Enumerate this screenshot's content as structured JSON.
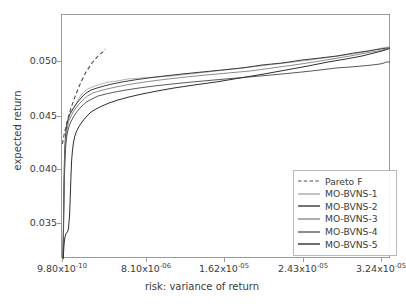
{
  "chart_data": {
    "type": "line",
    "title": "",
    "xlabel": "risk: variance of return",
    "ylabel": "expected return",
    "grid": false,
    "legend_position": "lower right",
    "xlim": [
      9.8e-10,
      3.24e-05
    ],
    "ylim": [
      0.032,
      0.0536
    ],
    "xticks": [
      {
        "value": 9.8e-10,
        "label": "9.80x10",
        "exp": "-10",
        "px": 62
      },
      {
        "value": 8.1e-06,
        "label": "8.10x10",
        "exp": "-06",
        "px": 146
      },
      {
        "value": 1.62e-05,
        "label": "1.62x10",
        "exp": "-05",
        "px": 224
      },
      {
        "value": 2.43e-05,
        "label": "2.43x10",
        "exp": "-05",
        "px": 303
      },
      {
        "value": 3.24e-05,
        "label": "3.24x10",
        "exp": "-05",
        "px": 381
      }
    ],
    "yticks": [
      {
        "value": 0.05,
        "label": "0.050",
        "px": 61
      },
      {
        "value": 0.045,
        "label": "0.045",
        "px": 116
      },
      {
        "value": 0.04,
        "label": "0.040",
        "px": 169
      },
      {
        "value": 0.035,
        "label": "0.035",
        "px": 223
      }
    ],
    "series": [
      {
        "name": "Pareto F",
        "color": "#4a4a4a",
        "style": "dashed",
        "width": 1.1,
        "points": [
          [
            0.4,
            129
          ],
          [
            2.0,
            120
          ],
          [
            5.0,
            107
          ],
          [
            9.0,
            93
          ],
          [
            14.0,
            79
          ],
          [
            19.0,
            67
          ],
          [
            24.0,
            57
          ],
          [
            30.0,
            48
          ],
          [
            36.0,
            41
          ],
          [
            42.0,
            36
          ],
          [
            43.0,
            34
          ]
        ]
      },
      {
        "name": "MO-BVNS-1",
        "color": "#a9a9a9",
        "style": "solid",
        "width": 0.9,
        "points": [
          [
            1.0,
            243
          ],
          [
            1.2,
            230
          ],
          [
            1.4,
            215
          ],
          [
            1.6,
            200
          ],
          [
            1.8,
            188
          ],
          [
            2.0,
            176
          ],
          [
            2.2,
            166
          ],
          [
            2.4,
            158
          ],
          [
            2.6,
            150
          ],
          [
            2.9,
            142
          ],
          [
            3.2,
            134
          ],
          [
            3.6,
            128
          ],
          [
            4.0,
            122
          ],
          [
            4.6,
            116
          ],
          [
            5.4,
            110
          ],
          [
            6.2,
            105
          ],
          [
            7.2,
            101
          ],
          [
            8.4,
            99
          ],
          [
            10.0,
            96
          ],
          [
            12.0,
            92
          ],
          [
            14.6,
            88
          ],
          [
            17.0,
            83
          ],
          [
            20.0,
            79
          ],
          [
            24.0,
            75
          ],
          [
            28.0,
            73
          ],
          [
            33.0,
            71
          ],
          [
            39.0,
            69
          ],
          [
            46.0,
            67
          ],
          [
            55.0,
            66
          ],
          [
            66.0,
            64
          ],
          [
            80.0,
            63
          ],
          [
            95.0,
            62
          ],
          [
            110.0,
            61
          ],
          [
            128.0,
            59
          ],
          [
            145.0,
            57
          ],
          [
            162.0,
            55
          ],
          [
            180.0,
            53
          ],
          [
            198.0,
            51
          ],
          [
            214.0,
            49
          ],
          [
            232.0,
            47
          ],
          [
            248.0,
            45
          ],
          [
            262.0,
            43
          ],
          [
            276.0,
            41
          ],
          [
            290.0,
            39
          ],
          [
            302.0,
            37
          ],
          [
            312.0,
            35
          ],
          [
            320.0,
            33
          ],
          [
            326.0,
            32
          ],
          [
            328.0,
            32
          ]
        ]
      },
      {
        "name": "MO-BVNS-2",
        "color": "#3c3c3c",
        "style": "solid",
        "width": 1.0,
        "points": [
          [
            1.0,
            244
          ],
          [
            1.1,
            236
          ],
          [
            1.3,
            222
          ],
          [
            1.5,
            206
          ],
          [
            1.7,
            190
          ],
          [
            1.9,
            176
          ],
          [
            2.1,
            162
          ],
          [
            2.3,
            150
          ],
          [
            2.6,
            140
          ],
          [
            2.9,
            131
          ],
          [
            3.3,
            124
          ],
          [
            3.8,
            118
          ],
          [
            4.4,
            113
          ],
          [
            5.2,
            108
          ],
          [
            6.2,
            104
          ],
          [
            7.4,
            100
          ],
          [
            9.0,
            97
          ],
          [
            11.0,
            94
          ],
          [
            13.5,
            90
          ],
          [
            16.5,
            86
          ],
          [
            20.0,
            82
          ],
          [
            24.0,
            78
          ],
          [
            29.0,
            75
          ],
          [
            35.0,
            73
          ],
          [
            42.0,
            71
          ],
          [
            50.0,
            69
          ],
          [
            60.0,
            67
          ],
          [
            72.0,
            65
          ],
          [
            86.0,
            63
          ],
          [
            102.0,
            61
          ],
          [
            120.0,
            59
          ],
          [
            140.0,
            57
          ],
          [
            160.0,
            55
          ],
          [
            180.0,
            53
          ],
          [
            200.0,
            50
          ],
          [
            220.0,
            48
          ],
          [
            240.0,
            45
          ],
          [
            258.0,
            43
          ],
          [
            275.0,
            41
          ],
          [
            292.0,
            38
          ],
          [
            306.0,
            36
          ],
          [
            318.0,
            34
          ],
          [
            326.0,
            33
          ],
          [
            328.0,
            33
          ]
        ]
      },
      {
        "name": "MO-BVNS-3",
        "color": "#8c8c8c",
        "style": "solid",
        "width": 1.0,
        "points": [
          [
            1.0,
            245
          ],
          [
            1.2,
            234
          ],
          [
            1.5,
            218
          ],
          [
            1.8,
            198
          ],
          [
            2.1,
            178
          ],
          [
            2.4,
            162
          ],
          [
            2.7,
            150
          ],
          [
            3.0,
            140
          ],
          [
            3.4,
            132
          ],
          [
            3.9,
            125
          ],
          [
            4.5,
            119
          ],
          [
            5.3,
            113
          ],
          [
            6.3,
            108
          ],
          [
            7.6,
            104
          ],
          [
            9.2,
            101
          ],
          [
            11.2,
            97
          ],
          [
            13.8,
            93
          ],
          [
            17.0,
            89
          ],
          [
            21.0,
            85
          ],
          [
            25.5,
            81
          ],
          [
            31.0,
            78
          ],
          [
            37.0,
            76
          ],
          [
            45.0,
            74
          ],
          [
            54.0,
            72
          ],
          [
            64.0,
            70
          ],
          [
            76.0,
            68
          ],
          [
            90.0,
            66
          ],
          [
            106.0,
            64
          ],
          [
            124.0,
            62
          ],
          [
            144.0,
            60
          ],
          [
            166.0,
            58
          ],
          [
            188.0,
            56
          ],
          [
            210.0,
            53
          ],
          [
            232.0,
            50
          ],
          [
            252.0,
            47
          ],
          [
            270.0,
            44
          ],
          [
            288.0,
            41
          ],
          [
            304.0,
            38
          ],
          [
            316.0,
            36
          ],
          [
            324.0,
            34
          ],
          [
            328.0,
            33
          ]
        ]
      },
      {
        "name": "MO-BVNS-4",
        "color": "#5a5a5a",
        "style": "solid",
        "width": 1.0,
        "points": [
          [
            1.0,
            246
          ],
          [
            1.1,
            240
          ],
          [
            1.3,
            228
          ],
          [
            1.5,
            212
          ],
          [
            1.7,
            196
          ],
          [
            2.0,
            180
          ],
          [
            2.3,
            165
          ],
          [
            2.7,
            152
          ],
          [
            3.1,
            142
          ],
          [
            3.6,
            133
          ],
          [
            4.2,
            126
          ],
          [
            5.0,
            120
          ],
          [
            6.0,
            115
          ],
          [
            7.2,
            111
          ],
          [
            8.8,
            107
          ],
          [
            10.8,
            103
          ],
          [
            13.2,
            99
          ],
          [
            16.2,
            95
          ],
          [
            20.0,
            91
          ],
          [
            24.5,
            87
          ],
          [
            30.0,
            84
          ],
          [
            36.0,
            81
          ],
          [
            44.0,
            79
          ],
          [
            53.0,
            77
          ],
          [
            64.0,
            75
          ],
          [
            77.0,
            73
          ],
          [
            92.0,
            71
          ],
          [
            110.0,
            69
          ],
          [
            130.0,
            67
          ],
          [
            152.0,
            65
          ],
          [
            175.0,
            63
          ],
          [
            198.0,
            61
          ],
          [
            220.0,
            59
          ],
          [
            240.0,
            57
          ],
          [
            258.0,
            55
          ],
          [
            274.0,
            53
          ],
          [
            288.0,
            52
          ],
          [
            300.0,
            51
          ],
          [
            310.0,
            50
          ],
          [
            318.0,
            49
          ],
          [
            322.0,
            48
          ],
          [
            324.0,
            47
          ],
          [
            328.0,
            47
          ]
        ]
      },
      {
        "name": "MO-BVNS-5",
        "color": "#2f2f2f",
        "style": "solid",
        "width": 1.0,
        "points": [
          [
            1.0,
            247
          ],
          [
            1.2,
            243
          ],
          [
            1.5,
            238
          ],
          [
            1.9,
            232
          ],
          [
            2.4,
            226
          ],
          [
            3.0,
            222
          ],
          [
            3.8,
            219
          ],
          [
            4.6,
            218
          ],
          [
            5.4,
            217
          ],
          [
            6.4,
            214
          ],
          [
            7.6,
            200
          ],
          [
            8.4,
            178
          ],
          [
            9.0,
            160
          ],
          [
            9.6,
            146
          ],
          [
            10.4,
            136
          ],
          [
            11.4,
            128
          ],
          [
            12.6,
            122
          ],
          [
            14.2,
            117
          ],
          [
            16.2,
            113
          ],
          [
            18.6,
            109
          ],
          [
            21.5,
            105
          ],
          [
            25.0,
            101
          ],
          [
            29.0,
            97
          ],
          [
            34.0,
            94
          ],
          [
            40.0,
            91
          ],
          [
            47.0,
            88
          ],
          [
            56.0,
            85
          ],
          [
            67.0,
            82
          ],
          [
            80.0,
            79
          ],
          [
            95.0,
            76
          ],
          [
            112.0,
            73
          ],
          [
            132.0,
            70
          ],
          [
            154.0,
            67
          ],
          [
            178.0,
            63
          ],
          [
            202.0,
            59
          ],
          [
            224.0,
            55
          ],
          [
            246.0,
            51
          ],
          [
            266.0,
            47
          ],
          [
            284.0,
            44
          ],
          [
            300.0,
            41
          ],
          [
            312.0,
            38
          ],
          [
            320.0,
            36
          ],
          [
            326.0,
            34
          ],
          [
            328.0,
            33
          ]
        ]
      }
    ]
  },
  "legend": {
    "entries": [
      {
        "label": "Pareto F"
      },
      {
        "label": "MO-BVNS-1"
      },
      {
        "label": "MO-BVNS-2"
      },
      {
        "label": "MO-BVNS-3"
      },
      {
        "label": "MO-BVNS-4"
      },
      {
        "label": "MO-BVNS-5"
      }
    ]
  },
  "colors": {
    "axis": "#9a9a9a",
    "text": "#3b3b3b",
    "background": "#ffffff"
  }
}
